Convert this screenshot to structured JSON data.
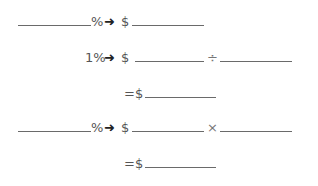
{
  "rows": [
    {
      "percent_label": "%",
      "arrow": "➜",
      "dollar": "$"
    },
    {
      "percent_label": "1%",
      "arrow": "➜",
      "dollar": "$",
      "operator": "÷"
    },
    {
      "equals": "=",
      "dollar": "$"
    },
    {
      "percent_label": "%",
      "arrow": "➜",
      "dollar": "$",
      "operator": "×"
    },
    {
      "equals": "=",
      "dollar": "$"
    }
  ]
}
